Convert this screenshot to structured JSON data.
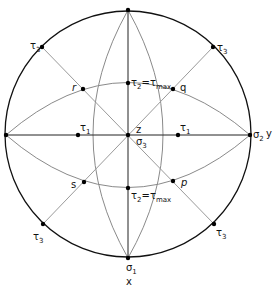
{
  "diagram": {
    "type": "stereographic-projection-stress-directions",
    "colors": {
      "circle": "#111111",
      "axes": "#222222",
      "great_circles": "#8a8a8a",
      "diagonals": "#9a9a9a",
      "points": "#000000"
    },
    "labels": {
      "sigma1": "σ",
      "sigma1_sub": "1",
      "x": "x",
      "sigma2": "σ",
      "sigma2_sub": "2",
      "y": "y",
      "sigma3": "σ",
      "sigma3_sub": "3",
      "z": "z",
      "tau1_left": "τ",
      "tau1_left_sub": "1",
      "tau1_right": "τ",
      "tau1_right_sub": "1",
      "tau2_top": "τ",
      "tau2_top_sub": "2",
      "tau2_top_eq": "=τ",
      "tau2_top_max": "max",
      "tau2_bottom": "τ",
      "tau2_bottom_sub": "2",
      "tau2_bottom_eq": "=τ",
      "tau2_bottom_max": "max",
      "tau3": "τ",
      "tau3_sub": "3",
      "q": "q",
      "r": "r",
      "s": "s",
      "p": "p"
    }
  }
}
